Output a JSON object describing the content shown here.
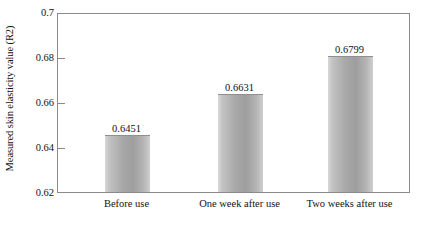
{
  "chart_data": {
    "type": "bar",
    "title": "",
    "xlabel": "",
    "ylabel": "Measured skin elasticity value (R2)",
    "categories": [
      "Before use",
      "One week after use",
      "Two weeks after use"
    ],
    "values": [
      0.6451,
      0.6631,
      0.6799
    ],
    "value_labels": [
      "0.6451",
      "0.6631",
      "0.6799"
    ],
    "ylim": [
      0.62,
      0.7
    ],
    "yticks": [
      0.62,
      0.64,
      0.66,
      0.68,
      0.7
    ],
    "ytick_labels": [
      "0.62",
      "0.64",
      "0.66",
      "0.68",
      "0.7"
    ],
    "grid": false,
    "legend": null,
    "bar_color": "#a9a9a9",
    "frame_color": "#8a8a8a",
    "text_color": "#121212"
  }
}
